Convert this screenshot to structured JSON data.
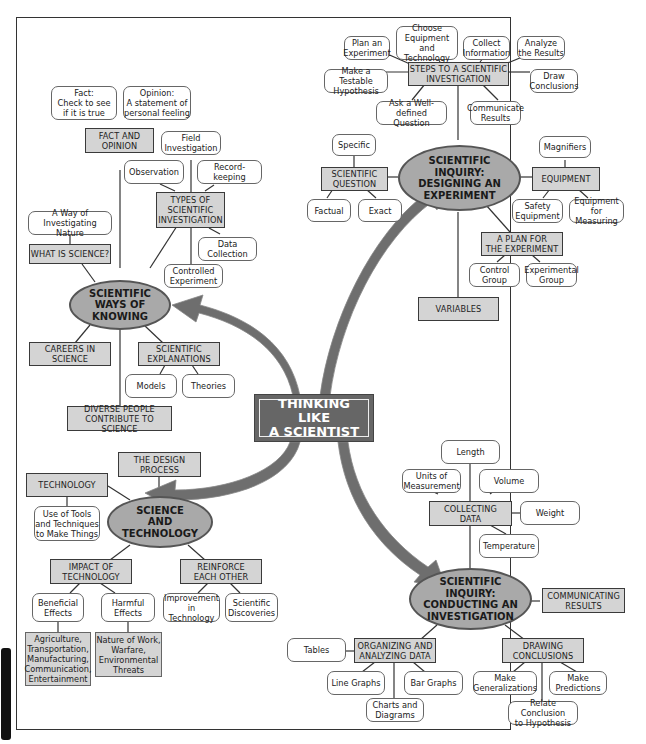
{
  "title": "THINKING LIKE\nA SCIENTIST",
  "colors": {
    "oval_fill": "#a9a9a9",
    "box_fill": "#d4d4d4",
    "center_fill": "#666666",
    "arrow": "#6e6e6e"
  },
  "designing": {
    "oval": "SCIENTIFIC\nINQUIRY:\nDESIGNING AN\nEXPERIMENT",
    "steps": {
      "label": "STEPS TO A SCIENTIFIC\nINVESTIGATION",
      "items": [
        "Plan an\nExperiment",
        "Choose\nEquipment and\nTechnology",
        "Collect\nInformation",
        "Analyze\nthe Results",
        "Make a Testable\nHypothesis",
        "Draw\nConclusions",
        "Ask a Well-defined\nQuestion",
        "Communicate\nResults"
      ]
    },
    "question": {
      "label": "SCIENTIFIC\nQUESTION",
      "items": [
        "Specific",
        "Factual",
        "Exact"
      ]
    },
    "equipment": {
      "label": "EQUIPMENT",
      "items": [
        "Magnifiers",
        "Safety\nEquipment",
        "Equipment for\nMeasuring"
      ]
    },
    "plan": {
      "label": "A PLAN FOR\nTHE EXPERIMENT",
      "items": [
        "Control\nGroup",
        "Experimental\nGroup"
      ]
    },
    "variables": "VARIABLES"
  },
  "knowing": {
    "oval": "SCIENTIFIC\nWAYS OF\nKNOWING",
    "fact": {
      "label": "FACT AND\nOPINION",
      "items": [
        "Fact:\nCheck to see\nif it is true",
        "Opinion:\nA statement of\npersonal feeling"
      ]
    },
    "types": {
      "label": "TYPES OF\nSCIENTIFIC\nINVESTIGATION",
      "items": [
        "Field\nInvestigation",
        "Observation",
        "Record-keeping",
        "Data\nCollection",
        "Controlled\nExperiment"
      ]
    },
    "what": {
      "label": "WHAT IS SCIENCE?",
      "items": [
        "A Way of\nInvestigating Nature"
      ]
    },
    "careers": "CAREERS IN\nSCIENCE",
    "explanations": {
      "label": "SCIENTIFIC\nEXPLANATIONS",
      "items": [
        "Models",
        "Theories"
      ]
    },
    "diverse": "DIVERSE PEOPLE\nCONTRIBUTE TO SCIENCE"
  },
  "technology": {
    "oval": "SCIENCE\nAND\nTECHNOLOGY",
    "design": "THE DESIGN\nPROCESS",
    "tech": {
      "label": "TECHNOLOGY",
      "items": [
        "Use of Tools\nand Techniques\nto Make Things"
      ]
    },
    "impact": {
      "label": "IMPACT OF\nTECHNOLOGY",
      "items": [
        "Beneficial\nEffects",
        "Harmful\nEffects"
      ],
      "details": [
        "Agriculture,\nTransportation,\nManufacturing,\nCommunication,\nEntertainment",
        "Nature of Work,\nWarfare,\nEnvironmental\nThreats"
      ]
    },
    "reinforce": {
      "label": "REINFORCE\nEACH OTHER",
      "items": [
        "Improvement\nin Technology",
        "Scientific\nDiscoveries"
      ]
    }
  },
  "conducting": {
    "oval": "SCIENTIFIC\nINQUIRY:\nCONDUCTING AN\nINVESTIGATION",
    "collecting": {
      "label": "COLLECTING\nDATA",
      "items": [
        "Length",
        "Units of\nMeasurement",
        "Volume",
        "Weight",
        "Temperature"
      ]
    },
    "communicating": "COMMUNICATING\nRESULTS",
    "organizing": {
      "label": "ORGANIZING AND\nANALYZING DATA",
      "items": [
        "Tables",
        "Line Graphs",
        "Bar Graphs",
        "Charts and\nDiagrams"
      ]
    },
    "drawing": {
      "label": "DRAWING\nCONCLUSIONS",
      "items": [
        "Make\nGeneralizations",
        "Make\nPredictions",
        "Relate Conclusion\nto Hypothesis"
      ]
    }
  }
}
